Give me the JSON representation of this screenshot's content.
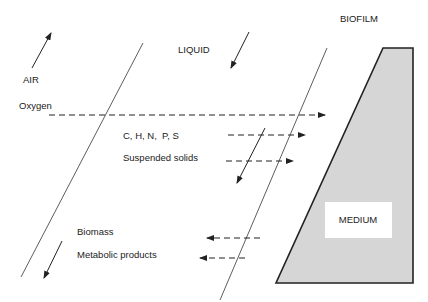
{
  "diagram": {
    "type": "biofilm-mass-transfer",
    "regions": {
      "air": "AIR",
      "liquid": "LIQUID",
      "biofilm": "BIOFILM",
      "medium": "MEDIUM"
    },
    "fluxes_into_biofilm": [
      {
        "label": "Oxygen",
        "direction": "right"
      },
      {
        "label": "C, H, N,  P, S",
        "direction": "right"
      },
      {
        "label": "Suspended solids",
        "direction": "right"
      }
    ],
    "fluxes_out_of_biofilm": [
      {
        "label": "Biomass",
        "direction": "left"
      },
      {
        "label": "Metabolic products",
        "direction": "left"
      }
    ],
    "colors": {
      "line": "#222222",
      "biofilm_fill": "#d6d6d6",
      "medium_fill": "#ffffff",
      "background": "#ffffff"
    }
  }
}
